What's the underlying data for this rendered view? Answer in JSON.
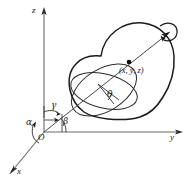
{
  "figure": {
    "type": "diagram",
    "background_color": "#ffffff",
    "stroke_color": "#1a1a1a",
    "axis_color": "#555555"
  },
  "axes": [
    {
      "name": "z-axis",
      "label": "z",
      "direction": "up"
    },
    {
      "name": "y-axis",
      "label": "y",
      "direction": "right"
    },
    {
      "name": "x-axis",
      "label": "x",
      "direction": "lower-left"
    }
  ],
  "origin": {
    "label": "O"
  },
  "angles": [
    {
      "name": "alpha",
      "label": "α",
      "description": "angle from x-axis to rotation axis"
    },
    {
      "name": "beta",
      "label": "β",
      "description": "angle from y-axis to rotation axis"
    },
    {
      "name": "gamma",
      "label": "γ",
      "description": "angle from z-axis to rotation axis"
    },
    {
      "name": "theta",
      "label": "θ",
      "description": "rotation angle in the circular cross-section"
    }
  ],
  "point": {
    "label": "(x, y, z)",
    "marker": "filled-dot"
  },
  "rotation": {
    "arrow": "curved-rotation-arrow",
    "axis_tip": "arrowhead"
  },
  "body": {
    "name": "rigid-body-outline"
  },
  "cross_section": {
    "name": "circular-cross-section"
  }
}
